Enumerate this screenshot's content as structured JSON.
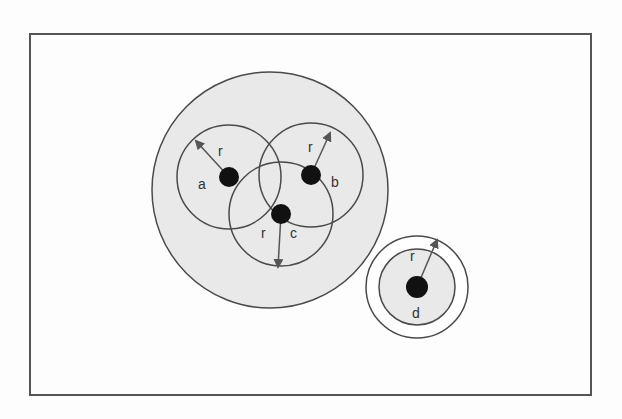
{
  "diagram": {
    "type": "network-communication-range",
    "colors": {
      "frame": "#555555",
      "region_fill": "#e9e9e9",
      "outline": "#4a4a4a",
      "node": "#111111",
      "background": "#fdfdfd"
    },
    "frame": {
      "x": 30,
      "y": 34,
      "width": 561,
      "height": 361
    },
    "cluster_range": {
      "cx": 270,
      "cy": 190,
      "r": 118
    },
    "nodes": [
      {
        "id": "a",
        "label": "a",
        "cx": 229,
        "cy": 177,
        "r": 10,
        "range_r": 52,
        "label_pos": {
          "x": 198,
          "y": 189
        },
        "radius_label": "r",
        "radius_label_pos": {
          "x": 218,
          "y": 156
        },
        "arrow_to": {
          "x": 196,
          "y": 141
        }
      },
      {
        "id": "b",
        "label": "b",
        "cx": 311,
        "cy": 175,
        "r": 10,
        "range_r": 52,
        "label_pos": {
          "x": 331,
          "y": 187
        },
        "radius_label": "r",
        "radius_label_pos": {
          "x": 308,
          "y": 152
        },
        "arrow_to": {
          "x": 330,
          "y": 133
        }
      },
      {
        "id": "c",
        "label": "c",
        "cx": 281,
        "cy": 214,
        "r": 10,
        "range_r": 52,
        "label_pos": {
          "x": 290,
          "y": 238
        },
        "radius_label": "r",
        "radius_label_pos": {
          "x": 261,
          "y": 238
        },
        "arrow_to": {
          "x": 278,
          "y": 267
        }
      },
      {
        "id": "d",
        "label": "d",
        "cx": 417,
        "cy": 287,
        "r": 11,
        "range_r": 38,
        "outer_r": 51,
        "label_pos": {
          "x": 412,
          "y": 318
        },
        "radius_label": "r",
        "radius_label_pos": {
          "x": 410,
          "y": 261
        },
        "arrow_to": {
          "x": 437,
          "y": 240
        }
      }
    ]
  }
}
